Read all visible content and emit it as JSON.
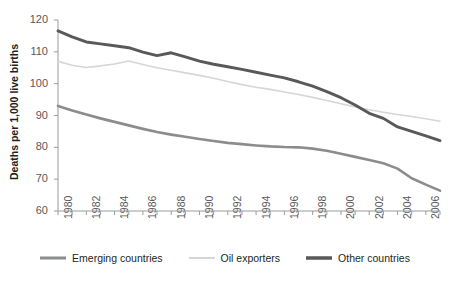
{
  "chart_data": {
    "type": "line",
    "title": "",
    "xlabel": "",
    "ylabel": "Deaths per 1,000 live births",
    "xlim": [
      1980,
      2007
    ],
    "ylim": [
      60,
      120
    ],
    "yticks": [
      60,
      70,
      80,
      90,
      100,
      110,
      120
    ],
    "ytick_labels": [
      "60",
      "70",
      "80",
      "90",
      "100",
      "110",
      "120"
    ],
    "x": [
      1980,
      1981,
      1982,
      1983,
      1984,
      1985,
      1986,
      1987,
      1988,
      1989,
      1990,
      1991,
      1992,
      1993,
      1994,
      1995,
      1996,
      1997,
      1998,
      1999,
      2000,
      2001,
      2002,
      2003,
      2004,
      2005,
      2006,
      2007
    ],
    "xtick_labels": [
      "1980",
      "1982",
      "1984",
      "1986",
      "1988",
      "1990",
      "1992",
      "1994",
      "1996",
      "1998",
      "2000",
      "2002",
      "2004",
      "2006"
    ],
    "xtick_label_years": [
      1980,
      1982,
      1984,
      1986,
      1988,
      1990,
      1992,
      1994,
      1996,
      1998,
      2000,
      2002,
      2004,
      2006
    ],
    "grid": false,
    "legend_position": "bottom",
    "series": [
      {
        "name": "Emerging countries",
        "color": "#8a8c8e",
        "width": 2.6,
        "values": [
          93.0,
          91.6,
          90.3,
          89.1,
          88.0,
          86.9,
          85.8,
          84.8,
          84.0,
          83.3,
          82.6,
          82.0,
          81.4,
          81.0,
          80.6,
          80.3,
          80.1,
          80.0,
          79.6,
          78.9,
          78.0,
          77.0,
          76.0,
          75.0,
          73.3,
          70.3,
          68.3,
          66.4
        ]
      },
      {
        "name": "Oil exporters",
        "color": "#d5d6d8",
        "width": 1.6,
        "values": [
          107.0,
          105.8,
          105.1,
          105.6,
          106.2,
          107.1,
          106.0,
          105.0,
          104.2,
          103.4,
          102.6,
          101.7,
          100.7,
          99.7,
          98.9,
          98.2,
          97.4,
          96.6,
          95.7,
          94.7,
          93.7,
          92.7,
          91.8,
          91.0,
          90.3,
          89.7,
          89.0,
          88.2
        ]
      },
      {
        "name": "Other countries",
        "color": "#58595b",
        "width": 2.9,
        "values": [
          116.6,
          114.7,
          113.1,
          112.5,
          111.9,
          111.3,
          109.9,
          108.8,
          109.7,
          108.4,
          107.1,
          106.1,
          105.3,
          104.5,
          103.6,
          102.7,
          101.8,
          100.6,
          99.2,
          97.5,
          95.6,
          93.3,
          90.7,
          89.1,
          86.4,
          85.0,
          83.6,
          82.1
        ]
      }
    ]
  },
  "legend": {
    "items": [
      {
        "label": "Emerging countries"
      },
      {
        "label": "Oil exporters"
      },
      {
        "label": "Other countries"
      }
    ]
  }
}
